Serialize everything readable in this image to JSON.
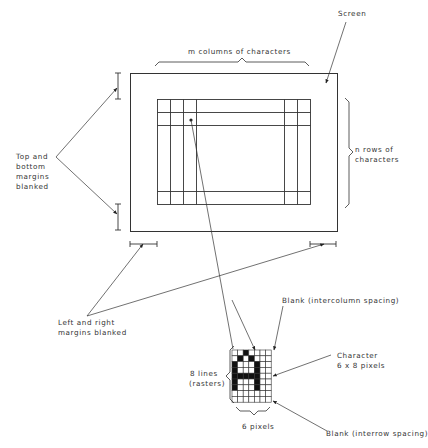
{
  "diagram": {
    "labels": {
      "screen": "Screen",
      "columns": "m columns of characters",
      "rows_line1": "n rows of",
      "rows_line2": "characters",
      "top_bottom_line1": "Top and",
      "top_bottom_line2": "bottom",
      "top_bottom_line3": "margins",
      "top_bottom_line4": "blanked",
      "left_right_line1": "Left and right",
      "left_right_line2": "margins blanked",
      "intercolumn": "Blank (intercolumn spacing)",
      "character_line1": "Character",
      "character_line2": "6 x 8 pixels",
      "lines_line1": "8 lines",
      "lines_line2": "(rasters)",
      "pixels": "6 pixels",
      "interrow": "Blank (interrow spacing)"
    },
    "character_cell": {
      "glyph": "A",
      "columns": 7,
      "rows": 9,
      "character_width_pixels": 6,
      "character_height_lines": 8,
      "bitmap": [
        "..X....",
        ".X.X...",
        "X...X..",
        "X...X..",
        "XXXXX..",
        "X...X..",
        "X...X..",
        ".......",
        "......."
      ]
    },
    "colors": {
      "line": "#333333",
      "fill": "#111111",
      "background": "#ffffff"
    }
  }
}
